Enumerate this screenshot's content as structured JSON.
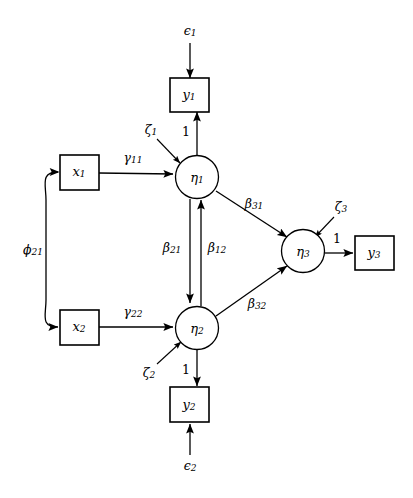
{
  "diagram": {
    "type": "sem-path-diagram",
    "background_color": "#ffffff",
    "stroke_color": "#000000"
  },
  "nodes": {
    "observed_exogenous": [
      {
        "id": "x1",
        "label": "x",
        "subscript": "1",
        "shape": "rectangle",
        "x": 79,
        "y": 172
      },
      {
        "id": "x2",
        "label": "x",
        "subscript": "2",
        "shape": "rectangle",
        "x": 79,
        "y": 327
      }
    ],
    "observed_endogenous": [
      {
        "id": "y1",
        "label": "y",
        "subscript": "1",
        "shape": "rectangle",
        "x": 189,
        "y": 94
      },
      {
        "id": "y2",
        "label": "y",
        "subscript": "2",
        "shape": "rectangle",
        "x": 189,
        "y": 405
      },
      {
        "id": "y3",
        "label": "y",
        "subscript": "3",
        "shape": "rectangle",
        "x": 374,
        "y": 253
      }
    ],
    "latent": [
      {
        "id": "eta1",
        "label": "η",
        "subscript": "1",
        "shape": "circle",
        "x": 197,
        "y": 177
      },
      {
        "id": "eta2",
        "label": "η",
        "subscript": "2",
        "shape": "circle",
        "x": 197,
        "y": 328
      },
      {
        "id": "eta3",
        "label": "η",
        "subscript": "3",
        "shape": "circle",
        "x": 303,
        "y": 251
      }
    ],
    "disturbances": [
      {
        "id": "zeta1",
        "label": "ζ",
        "subscript": "1",
        "target": "eta1",
        "x": 151,
        "y": 130
      },
      {
        "id": "zeta2",
        "label": "ζ",
        "subscript": "2",
        "target": "eta2",
        "x": 149,
        "y": 373
      },
      {
        "id": "zeta3",
        "label": "ζ",
        "subscript": "3",
        "target": "eta3",
        "x": 341,
        "y": 207
      }
    ],
    "errors": [
      {
        "id": "epsilon1",
        "label": "ϵ",
        "subscript": "1",
        "target": "y1",
        "x": 190,
        "y": 31
      },
      {
        "id": "epsilon2",
        "label": "ϵ",
        "subscript": "2",
        "target": "y2",
        "x": 190,
        "y": 466
      }
    ]
  },
  "edges": {
    "structural_paths": [
      {
        "id": "gamma11",
        "label": "γ",
        "subscript": "11",
        "from": "x1",
        "to": "eta1",
        "label_x": 133,
        "label_y": 158
      },
      {
        "id": "gamma22",
        "label": "γ",
        "subscript": "22",
        "from": "x2",
        "to": "eta2",
        "label_x": 133,
        "label_y": 312
      },
      {
        "id": "beta21",
        "label": "β",
        "subscript": "21",
        "from": "eta1",
        "to": "eta2",
        "label_x": 172,
        "label_y": 248
      },
      {
        "id": "beta12",
        "label": "β",
        "subscript": "12",
        "from": "eta2",
        "to": "eta1",
        "label_x": 216,
        "label_y": 248
      },
      {
        "id": "beta31",
        "label": "β",
        "subscript": "31",
        "from": "eta1",
        "to": "eta3",
        "label_x": 254,
        "label_y": 204
      },
      {
        "id": "beta32",
        "label": "β",
        "subscript": "32",
        "from": "eta2",
        "to": "eta3",
        "label_x": 257,
        "label_y": 304
      }
    ],
    "covariance": [
      {
        "id": "phi21",
        "label": "ϕ",
        "subscript": "21",
        "between": [
          "x1",
          "x2"
        ],
        "double_headed": true,
        "label_x": 33,
        "label_y": 250
      }
    ],
    "loadings": [
      {
        "id": "lambda_y1",
        "label": "1",
        "from": "eta1",
        "to": "y1",
        "label_x": 186,
        "label_y": 131
      },
      {
        "id": "lambda_y2",
        "label": "1",
        "from": "eta2",
        "to": "y2",
        "label_x": 186,
        "label_y": 371
      },
      {
        "id": "lambda_y3",
        "label": "1",
        "from": "eta3",
        "to": "y3",
        "label_x": 337,
        "label_y": 239
      }
    ]
  }
}
